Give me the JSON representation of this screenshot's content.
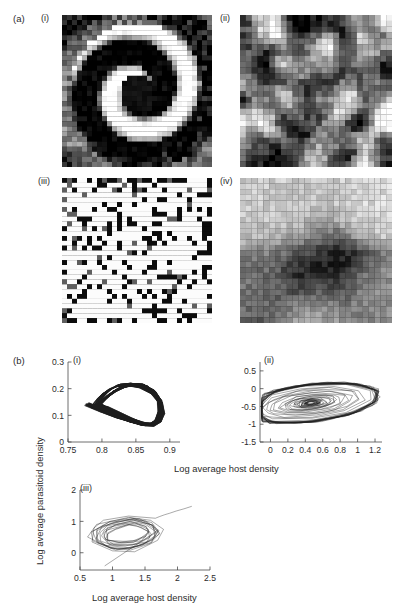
{
  "figure": {
    "part_a": {
      "label": "(a)",
      "panels": [
        {
          "roman": "(i)",
          "name": "spiral-wave-map",
          "pattern": "spiral"
        },
        {
          "roman": "(ii)",
          "name": "crystal-lattice-map",
          "pattern": "crystal"
        },
        {
          "roman": "(iii)",
          "name": "chaotic-speckle-map",
          "pattern": "speckle"
        },
        {
          "roman": "(iv)",
          "name": "large-scale-blob-map",
          "pattern": "blob"
        }
      ]
    },
    "part_b": {
      "label": "(b)",
      "xlabel": "Log average host density",
      "ylabel": "Log average parasitoid density",
      "panels": [
        {
          "roman": "(i)"
        },
        {
          "roman": "(ii)"
        },
        {
          "roman": "(iii)"
        }
      ]
    }
  },
  "chart_data": [
    {
      "type": "line",
      "name": "phase-portrait-i",
      "title": "(i)",
      "xlabel": "Log average host density",
      "ylabel": "Log average parasitoid density",
      "xlim": [
        0.75,
        0.915
      ],
      "ylim": [
        0,
        0.3
      ],
      "xticks": [
        "0.75",
        "0.8",
        "0.85",
        "0.9"
      ],
      "xtickvals": [
        0.75,
        0.8,
        0.85,
        0.9
      ],
      "yticks": [
        "0",
        "0.1",
        "0.2",
        "0.3"
      ],
      "ytickvals": [
        0,
        0.1,
        0.2,
        0.3
      ],
      "grid": false,
      "legend": "none",
      "description": "Dense quasi-periodic attractor loop, banded with many near-parallel orbits",
      "x": [
        0.778,
        0.8,
        0.823,
        0.845,
        0.861,
        0.874,
        0.884,
        0.889,
        0.886,
        0.875,
        0.858,
        0.84,
        0.824,
        0.812,
        0.803,
        0.797,
        0.793,
        0.79,
        0.788,
        0.787,
        0.789,
        0.795,
        0.806,
        0.822,
        0.841,
        0.858,
        0.872,
        0.881,
        0.886,
        0.885,
        0.877,
        0.864,
        0.848,
        0.833,
        0.82,
        0.81,
        0.803,
        0.798,
        0.794,
        0.791,
        0.79,
        0.792,
        0.798,
        0.809,
        0.825,
        0.843,
        0.86,
        0.874,
        0.883,
        0.887,
        0.885,
        0.876,
        0.862,
        0.846,
        0.831,
        0.818,
        0.809,
        0.802,
        0.797,
        0.793
      ],
      "y": [
        0.142,
        0.118,
        0.094,
        0.075,
        0.064,
        0.064,
        0.08,
        0.11,
        0.148,
        0.183,
        0.207,
        0.216,
        0.212,
        0.198,
        0.18,
        0.162,
        0.148,
        0.137,
        0.13,
        0.127,
        0.129,
        0.136,
        0.128,
        0.108,
        0.086,
        0.07,
        0.065,
        0.078,
        0.11,
        0.15,
        0.187,
        0.21,
        0.217,
        0.21,
        0.194,
        0.176,
        0.159,
        0.146,
        0.137,
        0.131,
        0.129,
        0.133,
        0.141,
        0.124,
        0.102,
        0.081,
        0.068,
        0.066,
        0.084,
        0.118,
        0.158,
        0.193,
        0.213,
        0.216,
        0.206,
        0.189,
        0.171,
        0.155,
        0.144,
        0.136
      ]
    },
    {
      "type": "line",
      "name": "phase-portrait-ii",
      "title": "(ii)",
      "xlabel": "Log average host density",
      "ylabel": "Log average parasitoid density",
      "xlim": [
        -0.12,
        1.28
      ],
      "ylim": [
        -1.5,
        0.75
      ],
      "xticks": [
        "0",
        "0.2",
        "0.4",
        "0.6",
        "0.8",
        "1",
        "1.2"
      ],
      "xtickvals": [
        0,
        0.2,
        0.4,
        0.6,
        0.8,
        1.0,
        1.2
      ],
      "yticks": [
        "0.5",
        "0",
        "-0.5",
        "-1",
        "-1.5"
      ],
      "ytickvals": [
        0.5,
        0,
        -0.5,
        -1,
        -1.5
      ],
      "grid": false,
      "legend": "none",
      "description": "Chaotic spiral-out polygonal orbits, centre near (0.45,-0.45)"
    },
    {
      "type": "line",
      "name": "phase-portrait-iii",
      "title": "(iii)",
      "xlabel": "Log average host density",
      "ylabel": "Log average parasitoid density",
      "xlim": [
        0.5,
        2.5
      ],
      "ylim": [
        -0.55,
        2.0
      ],
      "xticks": [
        "0.5",
        "1",
        "1.5",
        "2",
        "2.5"
      ],
      "xtickvals": [
        0.5,
        1.0,
        1.5,
        2.0,
        2.5
      ],
      "yticks": [
        "0",
        "1",
        "2"
      ],
      "ytickvals": [
        0,
        1,
        2
      ],
      "grid": false,
      "legend": "none",
      "description": "Transient spiralling-in trajectory entering from upper right, settling into a loop cluster"
    }
  ]
}
